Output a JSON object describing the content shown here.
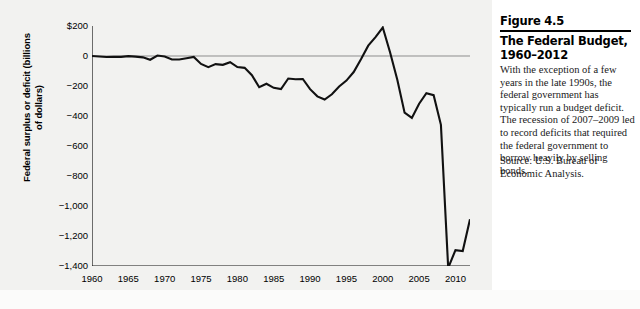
{
  "figure": {
    "number": "Figure 4.5",
    "title": "The Federal Budget, 1960–2012",
    "body": "With the exception of a few years in the late 1990s, the federal government has typically run a budget deficit. The recession of 2007–2009 led to record deficits that required the federal government to borrow heavily by selling bonds.",
    "source": "Source: U.S. Bureau of Economic Analysis."
  },
  "chart_data": {
    "type": "line",
    "title": "The Federal Budget, 1960–2012",
    "xlabel": "",
    "ylabel": "Federal surplus or deficit (billions of dollars)",
    "xlim": [
      1960,
      2012
    ],
    "ylim": [
      -1400,
      200
    ],
    "grid": false,
    "legend": "none",
    "zero_line": true,
    "y_ticks": [
      200,
      0,
      -200,
      -400,
      -600,
      -800,
      -1000,
      -1200,
      -1400
    ],
    "y_tick_labels": [
      "$200",
      "0",
      "−200",
      "−400",
      "−600",
      "−800",
      "−1,000",
      "−1,200",
      "−1,400"
    ],
    "x_ticks": [
      1960,
      1965,
      1970,
      1975,
      1980,
      1985,
      1990,
      1995,
      2000,
      2005,
      2010
    ],
    "x_tick_labels": [
      "1960",
      "1965",
      "1970",
      "1975",
      "1980",
      "1985",
      "1990",
      "1995",
      "2000",
      "2005",
      "2010"
    ],
    "line_color": "#111111",
    "x": [
      1960,
      1961,
      1962,
      1963,
      1964,
      1965,
      1966,
      1967,
      1968,
      1969,
      1970,
      1971,
      1972,
      1973,
      1974,
      1975,
      1976,
      1977,
      1978,
      1979,
      1980,
      1981,
      1982,
      1983,
      1984,
      1985,
      1986,
      1987,
      1988,
      1989,
      1990,
      1991,
      1992,
      1993,
      1994,
      1995,
      1996,
      1997,
      1998,
      1999,
      2000,
      2001,
      2002,
      2003,
      2004,
      2005,
      2006,
      2007,
      2008,
      2009,
      2010,
      2011,
      2012
    ],
    "values": [
      0,
      -3,
      -7,
      -5,
      -6,
      -1,
      -4,
      -9,
      -25,
      3,
      -3,
      -23,
      -23,
      -15,
      -6,
      -53,
      -74,
      -54,
      -59,
      -41,
      -74,
      -79,
      -128,
      -208,
      -185,
      -212,
      -221,
      -150,
      -155,
      -153,
      -221,
      -269,
      -290,
      -255,
      -203,
      -164,
      -107,
      -22,
      69,
      126,
      190,
      25,
      -158,
      -378,
      -413,
      -318,
      -248,
      -261,
      -459,
      -1413,
      -1294,
      -1300,
      -1089
    ]
  }
}
